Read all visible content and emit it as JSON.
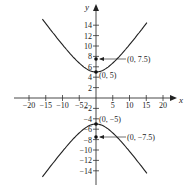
{
  "chart_data": {
    "type": "line",
    "title": "",
    "xlabel": "x",
    "ylabel": "y",
    "xlim": [
      -20,
      20
    ],
    "ylim": [
      -15,
      15
    ],
    "grid": false,
    "x_ticks": [
      -20,
      -15,
      -10,
      -5,
      5,
      10,
      15,
      20
    ],
    "x_tick_labels": [
      "−20",
      "−15",
      "−10",
      "−5",
      "5",
      "10",
      "15",
      "20"
    ],
    "x_extra_label": "2",
    "y_ticks": [
      14,
      12,
      10,
      8,
      6,
      4,
      2,
      -2,
      -4,
      -6,
      -8,
      -10,
      -12,
      -14
    ],
    "y_tick_labels": [
      "14",
      "12",
      "10",
      "8",
      "6",
      "4",
      "2",
      "−2",
      "−4",
      "−6",
      "−8",
      "−10",
      "−12",
      "−14"
    ],
    "equation": "y^2/25 - x^2/31.25 = 1",
    "series": [
      {
        "name": "upper branch",
        "description": "hyperbola opening upward, vertex (0,5)"
      },
      {
        "name": "lower branch",
        "description": "hyperbola opening downward, vertex (0,-5)"
      }
    ],
    "points": [
      {
        "x": 0,
        "y": 7.5,
        "label": "(0, 7.5)",
        "role": "focus",
        "arrow": true
      },
      {
        "x": 0,
        "y": 5,
        "label": "(0, 5)",
        "role": "vertex",
        "arrow": false
      },
      {
        "x": 0,
        "y": -5,
        "label": "(0, −5)",
        "role": "vertex",
        "arrow": false
      },
      {
        "x": 0,
        "y": -7.5,
        "label": "(0, −7.5)",
        "role": "focus",
        "arrow": true
      }
    ]
  }
}
